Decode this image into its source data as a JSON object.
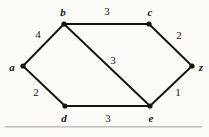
{
  "figure": {
    "kind": "weighted-undirected-graph",
    "background_color": "#fcfbf8",
    "ink_color": "#16140f",
    "rule_color": "#b9b7b2",
    "width": 209,
    "height": 137
  },
  "nodes": [
    {
      "id": "a",
      "label": "a",
      "x": 23,
      "y": 66,
      "label_x": 12,
      "label_y": 67
    },
    {
      "id": "b",
      "label": "b",
      "x": 64,
      "y": 24,
      "label_x": 63,
      "label_y": 12
    },
    {
      "id": "c",
      "label": "c",
      "x": 149,
      "y": 24,
      "label_x": 150,
      "label_y": 12
    },
    {
      "id": "d",
      "label": "d",
      "x": 65,
      "y": 106,
      "label_x": 64,
      "label_y": 118
    },
    {
      "id": "e",
      "label": "e",
      "x": 150,
      "y": 106,
      "label_x": 151,
      "label_y": 118
    },
    {
      "id": "z",
      "label": "z",
      "x": 192,
      "y": 66,
      "label_x": 201,
      "label_y": 67
    }
  ],
  "edges": [
    {
      "id": "ab",
      "from": "a",
      "to": "b",
      "weight": "4",
      "label_x": 38,
      "label_y": 34
    },
    {
      "id": "bc",
      "from": "b",
      "to": "c",
      "weight": "3",
      "label_x": 107,
      "label_y": 11
    },
    {
      "id": "cz",
      "from": "c",
      "to": "z",
      "weight": "2",
      "label_x": 179,
      "label_y": 35
    },
    {
      "id": "be",
      "from": "b",
      "to": "e",
      "weight": "3",
      "label_x": 113,
      "label_y": 60
    },
    {
      "id": "ad",
      "from": "a",
      "to": "d",
      "weight": "2",
      "label_x": 36,
      "label_y": 92
    },
    {
      "id": "de",
      "from": "d",
      "to": "e",
      "weight": "3",
      "label_x": 108,
      "label_y": 118
    },
    {
      "id": "ez",
      "from": "e",
      "to": "z",
      "weight": "1",
      "label_x": 178,
      "label_y": 92
    }
  ],
  "chart_data": {
    "type": "diagram",
    "title": "",
    "vertices": [
      "a",
      "b",
      "c",
      "d",
      "e",
      "z"
    ],
    "edge_list": [
      {
        "u": "a",
        "v": "b",
        "weight": 4
      },
      {
        "u": "b",
        "v": "c",
        "weight": 3
      },
      {
        "u": "c",
        "v": "z",
        "weight": 2
      },
      {
        "u": "b",
        "v": "e",
        "weight": 3
      },
      {
        "u": "a",
        "v": "d",
        "weight": 2
      },
      {
        "u": "d",
        "v": "e",
        "weight": 3
      },
      {
        "u": "e",
        "v": "z",
        "weight": 1
      }
    ]
  }
}
